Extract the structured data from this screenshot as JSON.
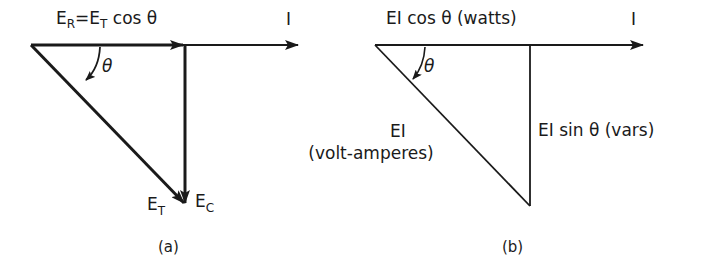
{
  "diagram_a": {
    "top_label": {
      "E": "E",
      "R_sub": "R",
      "eq": "=E",
      "T_sub": "T",
      "rest": " cos θ"
    },
    "current_label": "I",
    "angle_label": "θ",
    "total_label": {
      "E": "E",
      "sub": "T"
    },
    "capacitive_label": {
      "E": "E",
      "sub": "C"
    },
    "caption": "(a)"
  },
  "diagram_b": {
    "top_label": "EI cos θ (watts)",
    "current_label": "I",
    "angle_label": "θ",
    "hyp_label_line1": "EI",
    "hyp_label_line2": "(volt-amperes)",
    "vert_label": "EI sin θ (vars)",
    "caption": "(b)"
  }
}
